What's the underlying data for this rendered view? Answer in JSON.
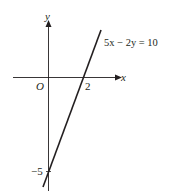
{
  "diagram": {
    "type": "coordinate-graph",
    "axes": {
      "x_label": "x",
      "y_label": "y",
      "origin_label": "O"
    },
    "line": {
      "equation": "5x − 2y = 10",
      "x_intercept_label": "2",
      "y_intercept_label": "−5"
    },
    "colors": {
      "axis": "#231f20",
      "line": "#231f20",
      "background": "#ffffff"
    }
  }
}
